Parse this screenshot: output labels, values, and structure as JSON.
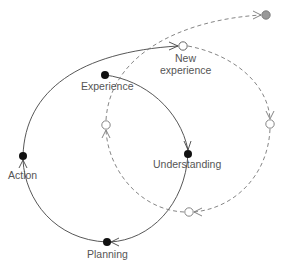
{
  "diagram": {
    "type": "learning-cycle",
    "colors": {
      "solid_line": "#444444",
      "dashed_line": "#777777",
      "filled_node": "#111111",
      "open_node_fill": "#ffffff",
      "terminal_node": "#999999",
      "label": "#555555"
    },
    "nodes": {
      "experience": {
        "label": "Experience"
      },
      "understanding": {
        "label": "Understanding"
      },
      "planning": {
        "label": "Planning"
      },
      "action": {
        "label": "Action"
      },
      "new_experience": {
        "label_line1": "New",
        "label_line2": "experience"
      }
    },
    "edges": [
      {
        "from": "Experience",
        "to": "Understanding",
        "style": "solid"
      },
      {
        "from": "Understanding",
        "to": "Planning",
        "style": "solid"
      },
      {
        "from": "Planning",
        "to": "Action",
        "style": "solid"
      },
      {
        "from": "Action",
        "to": "New experience",
        "style": "solid"
      },
      {
        "from": "New experience",
        "to": "right-open-node",
        "style": "dashed"
      },
      {
        "from": "right-open-node",
        "to": "bottom-open-node",
        "style": "dashed"
      },
      {
        "from": "bottom-open-node",
        "to": "left-open-node",
        "style": "dashed"
      },
      {
        "from": "left-open-node",
        "to": "top-right-node",
        "style": "dashed"
      }
    ]
  }
}
